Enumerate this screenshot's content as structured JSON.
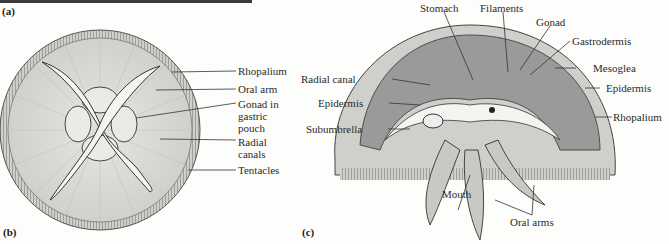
{
  "figure": {
    "panels": {
      "a": "(a)",
      "b": "(b)",
      "c": "(c)"
    },
    "panel_b": {
      "title": "Top view of medusa",
      "labels": {
        "rhopalium": "Rhopalium",
        "oral_arm": "Oral arm",
        "gonad_1": "Gonad in",
        "gonad_2": "gastric",
        "gonad_3": "pouch",
        "radial_1": "Radial",
        "radial_2": "canals",
        "tentacles": "Tentacles"
      }
    },
    "panel_c": {
      "labels": {
        "stomach": "Stomach",
        "filaments": "Filaments",
        "gonad": "Gonad",
        "gastrodermis": "Gastrodermis",
        "mesoglea": "Mesoglea",
        "epidermis_right": "Epidermis",
        "rhopalium": "Rhopalium",
        "radial_canal": "Radial canal",
        "epidermis_left": "Epidermis",
        "subumbrella": "Subumbrella",
        "mouth": "Mouth",
        "oral_arms": "Oral arms"
      }
    },
    "colors": {
      "mesoglea": "#9a9a9a",
      "bell": "#d9d9d6",
      "line": "#333333"
    }
  }
}
